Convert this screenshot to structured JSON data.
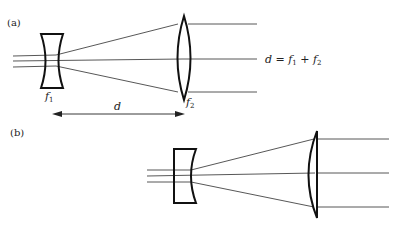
{
  "figure": {
    "panel_a": {
      "label": "(a)",
      "lens1_label": "f",
      "lens1_sub": "1",
      "lens2_label": "f",
      "lens2_sub": "2",
      "distance_label": "d",
      "equation": {
        "lhs": "d",
        "eq": " = ",
        "t1": "f",
        "t1_sub": "1",
        "plus": " + ",
        "t2": "f",
        "t2_sub": "2"
      }
    },
    "panel_b": {
      "label": "(b)"
    }
  }
}
